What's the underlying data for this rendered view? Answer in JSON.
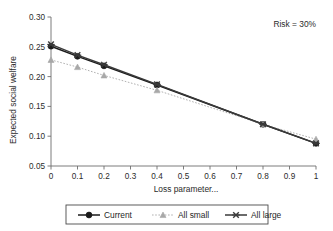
{
  "chart_data": {
    "type": "line",
    "title": "",
    "xlabel": "Loss parameter...",
    "ylabel": "Expected social welfare",
    "xlim": [
      0,
      1
    ],
    "ylim": [
      0.05,
      0.3
    ],
    "grid": false,
    "legend_position": "bottom",
    "annotation": "Risk = 30%",
    "x_ticks": [
      "0",
      "0.1",
      "0.2",
      "0.3",
      "0.4",
      "0.5",
      "0.6",
      "0.7",
      "0.8",
      "0.9",
      "1"
    ],
    "x_tick_values": [
      0,
      0.1,
      0.2,
      0.3,
      0.4,
      0.5,
      0.6,
      0.7,
      0.8,
      0.9,
      1
    ],
    "y_ticks": [
      "0.05",
      "0.10",
      "0.15",
      "0.20",
      "0.25",
      "0.30"
    ],
    "y_tick_values": [
      0.05,
      0.1,
      0.15,
      0.2,
      0.25,
      0.3
    ],
    "x": [
      0,
      0.1,
      0.2,
      0.4,
      0.8,
      1
    ],
    "series": [
      {
        "name": "Current",
        "marker": "filled-circle",
        "color": "#1a1a1a",
        "linestyle": "solid",
        "values": [
          0.251,
          0.234,
          0.218,
          0.186,
          0.12,
          0.088
        ]
      },
      {
        "name": "All small",
        "marker": "triangle",
        "color": "#a8a8a8",
        "linestyle": "dotted",
        "values": [
          0.228,
          0.216,
          0.202,
          0.177,
          0.12,
          0.095
        ]
      },
      {
        "name": "All large",
        "marker": "x-cross",
        "color": "#3a3a3a",
        "linestyle": "solid",
        "values": [
          0.254,
          0.236,
          0.22,
          0.187,
          0.12,
          0.088
        ]
      }
    ]
  },
  "legend": {
    "items": [
      {
        "label": "Current"
      },
      {
        "label": "All small"
      },
      {
        "label": "All large"
      }
    ]
  }
}
